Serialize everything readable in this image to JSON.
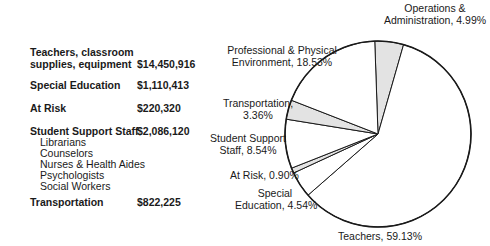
{
  "table": {
    "rows": [
      {
        "label_line1": "Teachers, classroom",
        "label_line2": "supplies, equipment",
        "amount": "$14,450,916"
      },
      {
        "label_line1": "Special Education",
        "amount": "$1,110,413"
      },
      {
        "label_line1": "At Risk",
        "amount": "$220,320"
      },
      {
        "label_line1": "Student Support Staff",
        "amount": "$2,086,120"
      },
      {
        "label_line1": "Transportation",
        "amount": "$822,225"
      }
    ],
    "student_support_subitems": [
      "Librarians",
      "Counselors",
      "Nurses & Health Aides",
      "Psychologists",
      "Social Workers"
    ]
  },
  "chart_data": {
    "type": "pie",
    "title": "",
    "slices": [
      {
        "label": "Operations & Administration",
        "value": 4.99,
        "shaded": true
      },
      {
        "label": "Teachers",
        "value": 59.13,
        "shaded": false
      },
      {
        "label": "Special Education",
        "value": 4.54,
        "shaded": false
      },
      {
        "label": "At Risk",
        "value": 0.9,
        "shaded": true
      },
      {
        "label": "Student Support Staff",
        "value": 8.54,
        "shaded": false
      },
      {
        "label": "Transportation",
        "value": 3.36,
        "shaded": true
      },
      {
        "label": "Professional & Physical Environment",
        "value": 18.53,
        "shaded": false
      }
    ],
    "labels": {
      "ops_l1": "Operations &",
      "ops_l2": "Administration, 4.99%",
      "prof_l1": "Professional & Physical",
      "prof_l2": "Environment, 18.53%",
      "trans_l1": "Transportation,",
      "trans_l2": "3.36%",
      "sss_l1": "Student Support",
      "sss_l2": "Staff, 8.54%",
      "atrisk": "At Risk, 0.90%",
      "sped_l1": "Special",
      "sped_l2": "Education, 4.54%",
      "teachers": "Teachers, 59.13%"
    },
    "colors": {
      "shaded": "#e3e3e3",
      "unshaded": "#ffffff",
      "stroke": "#1a1a1a"
    }
  }
}
